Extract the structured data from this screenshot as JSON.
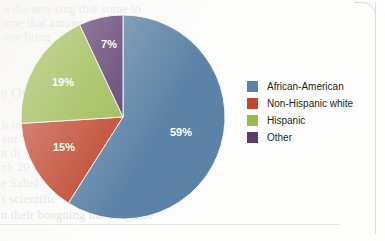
{
  "card": {
    "background_color": "#fdfdfc",
    "edge_color": "#dcdcd8"
  },
  "chart_data": {
    "type": "pie",
    "title": "",
    "subtitle": "",
    "xlabel": "",
    "ylabel": "",
    "legend_position": "right",
    "grid": false,
    "units": "percent",
    "start_angle_deg": 0,
    "direction": "clockwise",
    "categories": [
      "African-American",
      "Non-Hispanic white",
      "Hispanic",
      "Other"
    ],
    "values": [
      59,
      15,
      19,
      7
    ],
    "value_labels": [
      "59%",
      "15%",
      "19%",
      "7%"
    ],
    "colors": [
      "#5B83A8",
      "#C0462E",
      "#9BBB4F",
      "#5B3A70"
    ],
    "slices": [
      {
        "label": "African-American",
        "value": 59,
        "display": "59%",
        "color": "#5B83A8",
        "label_x": 181,
        "label_y": 133
      },
      {
        "label": "Non-Hispanic white",
        "value": 15,
        "display": "15%",
        "color": "#C0462E",
        "label_x": 64,
        "label_y": 148
      },
      {
        "label": "Hispanic",
        "value": 19,
        "display": "19%",
        "color": "#9BBB4F",
        "label_x": 63,
        "label_y": 83
      },
      {
        "label": "Other",
        "value": 7,
        "display": "7%",
        "color": "#5B3A70",
        "label_x": 109,
        "label_y": 45
      }
    ]
  },
  "legend": {
    "items": [
      {
        "label": "African-American",
        "color": "#5B83A8"
      },
      {
        "label": "Non-Hispanic white",
        "color": "#C0462E"
      },
      {
        "label": "Hispanic",
        "color": "#9BBB4F"
      },
      {
        "label": "Other",
        "color": "#5B3A70"
      }
    ]
  },
  "show_through_text": {
    "lines": [
      {
        "text": "a dia non-ring that some to",
        "x": 4,
        "y": 2,
        "size": 12,
        "opacity": 0.22
      },
      {
        "text": "ome that among the to",
        "x": 2,
        "y": 16,
        "size": 12,
        "opacity": 0.26
      },
      {
        "text": "one bring",
        "x": 3,
        "y": 30,
        "size": 12,
        "opacity": 0.22
      },
      {
        "text": "e Ou",
        "x": 1,
        "y": 86,
        "size": 14,
        "opacity": 0.22
      },
      {
        "text": "h to",
        "x": 2,
        "y": 118,
        "size": 12,
        "opacity": 0.2
      },
      {
        "text": "ent",
        "x": 2,
        "y": 132,
        "size": 12,
        "opacity": 0.2
      },
      {
        "text": "n di",
        "x": 1,
        "y": 146,
        "size": 12,
        "opacity": 0.2
      },
      {
        "text": "nh 20",
        "x": 1,
        "y": 160,
        "size": 12,
        "opacity": 0.22
      },
      {
        "text": "e Salud",
        "x": 1,
        "y": 176,
        "size": 12,
        "opacity": 0.24
      },
      {
        "text": "s scientific",
        "x": 1,
        "y": 192,
        "size": 12,
        "opacity": 0.24
      },
      {
        "text": "n their boogning ma hang tree",
        "x": 1,
        "y": 208,
        "size": 12,
        "opacity": 0.26
      }
    ]
  }
}
